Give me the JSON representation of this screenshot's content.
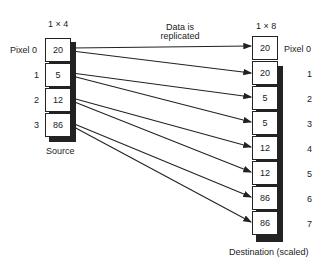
{
  "source": {
    "dims": "1 × 4",
    "label": "Source",
    "pixel_labels": [
      "Pixel 0",
      "1",
      "2",
      "3"
    ],
    "values": [
      "20",
      "5",
      "12",
      "86"
    ]
  },
  "destination": {
    "dims": "1 × 8",
    "label": "Destination (scaled)",
    "pixel_labels": [
      "Pixel 0",
      "1",
      "2",
      "3",
      "4",
      "5",
      "6",
      "7"
    ],
    "values": [
      "20",
      "20",
      "5",
      "5",
      "12",
      "12",
      "86",
      "86"
    ]
  },
  "annotation": {
    "line1": "Data is",
    "line2": "replicated"
  }
}
